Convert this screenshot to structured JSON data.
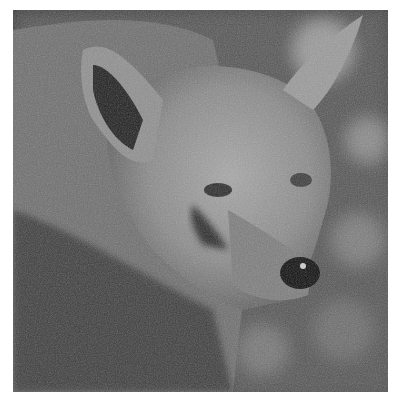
{
  "image": {
    "subject": "coyote head portrait",
    "style": "black-and-white photograph",
    "colors": {
      "background": "#ffffff",
      "fur_light": "#b5b5b5",
      "fur_mid": "#7a7a7a",
      "fur_dark": "#3a3a3a",
      "nose": "#0d0d0d",
      "bokeh": "#9a9a9a"
    }
  }
}
